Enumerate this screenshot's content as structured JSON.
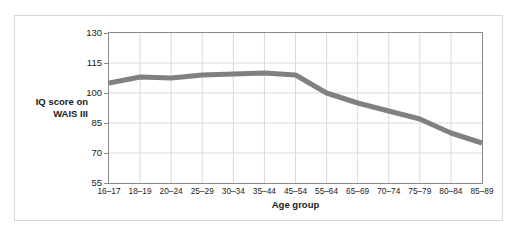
{
  "chart_data": {
    "type": "line",
    "title": "",
    "xlabel": "Age group",
    "ylabel": "IQ score on WAIS III",
    "ylabel_lines": [
      "IQ score on",
      "WAIS III"
    ],
    "categories": [
      "16–17",
      "18–19",
      "20–24",
      "25–29",
      "30–34",
      "35–44",
      "45–54",
      "55–64",
      "65–69",
      "70–74",
      "75–79",
      "80–84",
      "85–89"
    ],
    "values": [
      105,
      108,
      107.5,
      109,
      109.5,
      110,
      109,
      100,
      95,
      91,
      87,
      80,
      75
    ],
    "yticks": [
      55,
      70,
      85,
      100,
      115,
      130
    ],
    "ylim": [
      55,
      130
    ],
    "grid": true,
    "legend": "none",
    "series_color": "#808080",
    "grid_color": "#d9d9d9",
    "axis_color": "#8a8a8a",
    "line_width": 5
  }
}
